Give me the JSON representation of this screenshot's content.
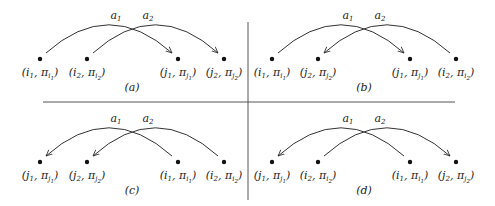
{
  "diagram": {
    "arc_labels": [
      "a1",
      "a2"
    ],
    "panels": [
      {
        "id": "a",
        "caption": "(a)",
        "nodes": [
          {
            "label": "(i1, πi1)",
            "main": "i",
            "idx": "1",
            "pimain": "i",
            "piidx": "1"
          },
          {
            "label": "(i2, πi2)",
            "main": "i",
            "idx": "2",
            "pimain": "i",
            "piidx": "2"
          },
          {
            "label": "(j1, πj1)",
            "main": "j",
            "idx": "1",
            "pimain": "j",
            "piidx": "1"
          },
          {
            "label": "(j2, πj2)",
            "main": "j",
            "idx": "2",
            "pimain": "j",
            "piidx": "2"
          }
        ],
        "arcs": [
          {
            "label": "a1",
            "from": 0,
            "to": 2
          },
          {
            "label": "a2",
            "from": 1,
            "to": 3
          }
        ]
      },
      {
        "id": "b",
        "caption": "(b)",
        "nodes": [
          {
            "label": "(i1, πi1)",
            "main": "i",
            "idx": "1",
            "pimain": "i",
            "piidx": "1"
          },
          {
            "label": "(j2, πj2)",
            "main": "j",
            "idx": "2",
            "pimain": "j",
            "piidx": "2"
          },
          {
            "label": "(j1, πj1)",
            "main": "j",
            "idx": "1",
            "pimain": "j",
            "piidx": "1"
          },
          {
            "label": "(i2, πi2)",
            "main": "i",
            "idx": "2",
            "pimain": "i",
            "piidx": "2"
          }
        ],
        "arcs": [
          {
            "label": "a1",
            "from": 0,
            "to": 2
          },
          {
            "label": "a2",
            "from": 3,
            "to": 1
          }
        ]
      },
      {
        "id": "c",
        "caption": "(c)",
        "nodes": [
          {
            "label": "(j1, πj1)",
            "main": "j",
            "idx": "1",
            "pimain": "j",
            "piidx": "1"
          },
          {
            "label": "(j2, πj2)",
            "main": "j",
            "idx": "2",
            "pimain": "j",
            "piidx": "2"
          },
          {
            "label": "(i1, πi1)",
            "main": "i",
            "idx": "1",
            "pimain": "i",
            "piidx": "1"
          },
          {
            "label": "(i2, πi2)",
            "main": "i",
            "idx": "2",
            "pimain": "i",
            "piidx": "2"
          }
        ],
        "arcs": [
          {
            "label": "a1",
            "from": 2,
            "to": 0
          },
          {
            "label": "a2",
            "from": 3,
            "to": 1
          }
        ]
      },
      {
        "id": "d",
        "caption": "(d)",
        "nodes": [
          {
            "label": "(j1, πj1)",
            "main": "j",
            "idx": "1",
            "pimain": "j",
            "piidx": "1"
          },
          {
            "label": "(i2, πi2)",
            "main": "i",
            "idx": "2",
            "pimain": "i",
            "piidx": "2"
          },
          {
            "label": "(i1, πi1)",
            "main": "i",
            "idx": "1",
            "pimain": "i",
            "piidx": "1"
          },
          {
            "label": "(j2, πj2)",
            "main": "j",
            "idx": "2",
            "pimain": "j",
            "piidx": "2"
          }
        ],
        "arcs": [
          {
            "label": "a1",
            "from": 2,
            "to": 0
          },
          {
            "label": "a2",
            "from": 1,
            "to": 3
          }
        ]
      }
    ],
    "colors": {
      "stroke": "#333333",
      "divider": "#555555",
      "text": "#222222"
    }
  }
}
